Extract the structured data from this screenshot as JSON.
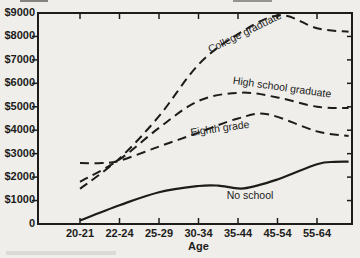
{
  "figure": {
    "background": "#efeeea",
    "ink": "#1d1c1a",
    "kind": "scanned statistics-book line chart of income by age and education"
  },
  "chart_data": {
    "type": "line",
    "title": "",
    "xlabel": "Age",
    "ylabel": "",
    "categories": [
      "20-21",
      "22-24",
      "25-29",
      "30-34",
      "35-44",
      "45-54",
      "55-64"
    ],
    "y_ticks": [
      {
        "value": 9000,
        "label": "$9000"
      },
      {
        "value": 8000,
        "label": "$8000"
      },
      {
        "value": 7000,
        "label": "$7000"
      },
      {
        "value": 6000,
        "label": "$6000"
      },
      {
        "value": 5000,
        "label": "$5000"
      },
      {
        "value": 4000,
        "label": "$4000"
      },
      {
        "value": 3000,
        "label": "$3000"
      },
      {
        "value": 2000,
        "label": "$2000"
      },
      {
        "value": 1000,
        "label": "$1000"
      },
      {
        "value": 0,
        "label": "0"
      }
    ],
    "ylim": [
      0,
      9000
    ],
    "grid": false,
    "legend_position": "labels-on-curves",
    "frame": "full box with inward ticks on all four sides, dollar ticks every $1000",
    "series": [
      {
        "name": "College graduate",
        "style": "dashed",
        "values": [
          1500,
          2800,
          4600,
          6800,
          8100,
          8900,
          8350
        ],
        "edge_value": 8200,
        "path_points": [
          [
            0,
            1500
          ],
          [
            1,
            2800
          ],
          [
            2,
            4600
          ],
          [
            3,
            6800
          ],
          [
            4,
            8100
          ],
          [
            5.05,
            8900
          ],
          [
            6,
            8350
          ],
          [
            6.8,
            8200
          ]
        ],
        "label_pos": {
          "x": 245,
          "y": 33,
          "rot": -26
        }
      },
      {
        "name": "High school graduate",
        "style": "dashed",
        "values": [
          1800,
          2750,
          4100,
          5250,
          5600,
          5400,
          5000
        ],
        "edge_value": 4950,
        "path_points": [
          [
            0,
            1800
          ],
          [
            1,
            2750
          ],
          [
            2,
            4100
          ],
          [
            3,
            5250
          ],
          [
            4.05,
            5600
          ],
          [
            5,
            5400
          ],
          [
            6,
            5000
          ],
          [
            6.8,
            4950
          ]
        ],
        "label_pos": {
          "x": 282,
          "y": 88,
          "rot": 8
        }
      },
      {
        "name": "Eighth grade",
        "style": "dashed",
        "values": [
          2600,
          2700,
          3300,
          3900,
          4500,
          4650,
          3950
        ],
        "edge_value": 3750,
        "path_points": [
          [
            0,
            2600
          ],
          [
            0.55,
            2600
          ],
          [
            1,
            2700
          ],
          [
            2,
            3300
          ],
          [
            3,
            3900
          ],
          [
            4,
            4500
          ],
          [
            4.75,
            4680
          ],
          [
            6,
            3950
          ],
          [
            6.8,
            3750
          ]
        ],
        "label_pos": {
          "x": 220,
          "y": 129,
          "rot": -8
        }
      },
      {
        "name": "No school",
        "style": "solid",
        "values": [
          150,
          800,
          1350,
          1600,
          1550,
          1900,
          2550
        ],
        "edge_value": 2660,
        "path_points": [
          [
            0,
            150
          ],
          [
            1,
            800
          ],
          [
            2,
            1350
          ],
          [
            3,
            1620
          ],
          [
            3.5,
            1640
          ],
          [
            4.15,
            1520
          ],
          [
            5,
            1900
          ],
          [
            6,
            2550
          ],
          [
            6.45,
            2650
          ],
          [
            6.8,
            2660
          ]
        ],
        "label_pos": {
          "x": 250,
          "y": 196,
          "rot": 0
        }
      }
    ]
  }
}
